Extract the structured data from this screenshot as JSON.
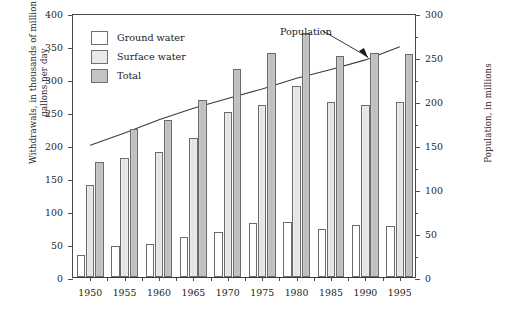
{
  "chart_data": {
    "type": "bar",
    "title": "",
    "categories": [
      "1950",
      "1955",
      "1960",
      "1965",
      "1970",
      "1975",
      "1980",
      "1985",
      "1990",
      "1995"
    ],
    "series": [
      {
        "name": "Ground water",
        "values": [
          34,
          47,
          50,
          60,
          68,
          82,
          83,
          73,
          79,
          77
        ],
        "color": "#ffffff"
      },
      {
        "name": "Surface water",
        "values": [
          140,
          180,
          190,
          210,
          250,
          260,
          290,
          265,
          260,
          265
        ],
        "color": "#e9e9e9"
      },
      {
        "name": "Total",
        "values": [
          175,
          225,
          238,
          268,
          315,
          340,
          370,
          335,
          340,
          338
        ],
        "color": "#c3c3c3"
      }
    ],
    "overlay_series": {
      "name": "Population",
      "axis": "right",
      "x": [
        "1950",
        "1955",
        "1960",
        "1965",
        "1970",
        "1975",
        "1980",
        "1985",
        "1990",
        "1995"
      ],
      "values": [
        152,
        166,
        181,
        194,
        205,
        216,
        228,
        238,
        249,
        264
      ],
      "unit": "millions"
    },
    "xlabel": "",
    "ylabel": "Withdrawals, in thousands of million gallons per day",
    "ylabel_right": "Population, in millions",
    "ylim": [
      0,
      400
    ],
    "ylim_right": [
      0,
      300
    ],
    "yticks": [
      0,
      50,
      100,
      150,
      200,
      250,
      300,
      350,
      400
    ],
    "yticks_right": [
      0,
      50,
      100,
      150,
      200,
      250,
      300
    ],
    "yticks_right_minor": [
      25,
      75,
      125,
      175,
      225,
      275
    ],
    "grid": false,
    "legend_position": "upper-left"
  },
  "legend": {
    "items": [
      {
        "label": "Ground water",
        "swatch": "sw-ground"
      },
      {
        "label": "Surface water",
        "swatch": "sw-surface"
      },
      {
        "label": "Total",
        "swatch": "sw-total"
      }
    ]
  },
  "annotations": {
    "population_label": "Population"
  },
  "axes": {
    "left_title": "Withdrawals, in thousands of million gallons per day",
    "right_title": "Population, in millions"
  }
}
